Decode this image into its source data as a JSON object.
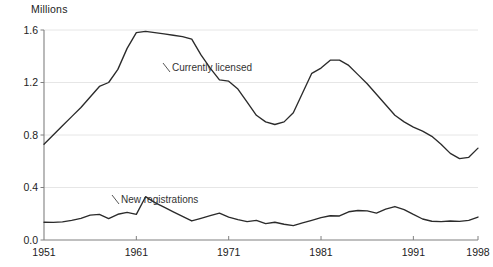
{
  "chart_data": {
    "type": "line",
    "title": "",
    "ylabel": "Millions",
    "xlabel": "",
    "ylim": [
      0.0,
      1.6
    ],
    "xlim": [
      1951,
      1998
    ],
    "grid": true,
    "legend_position": "inline-annotations",
    "y_ticks": [
      "0.0",
      "0.4",
      "0.8",
      "1.2",
      "1.6"
    ],
    "y_tick_values": [
      0.0,
      0.4,
      0.8,
      1.2,
      1.6
    ],
    "x_ticks": [
      "1951",
      "1961",
      "1971",
      "1981",
      "1991",
      "1998"
    ],
    "x_tick_values": [
      1951,
      1961,
      1971,
      1981,
      1991,
      1998
    ],
    "x": [
      1951,
      1952,
      1953,
      1954,
      1955,
      1956,
      1957,
      1958,
      1959,
      1960,
      1961,
      1962,
      1963,
      1964,
      1965,
      1966,
      1967,
      1968,
      1969,
      1970,
      1971,
      1972,
      1973,
      1974,
      1975,
      1976,
      1977,
      1978,
      1979,
      1980,
      1981,
      1982,
      1983,
      1984,
      1985,
      1986,
      1987,
      1988,
      1989,
      1990,
      1991,
      1992,
      1993,
      1994,
      1995,
      1996,
      1997,
      1998
    ],
    "series": [
      {
        "name": "Currently licensed",
        "label_text": "Currently licensed",
        "color": "#2b2b2b",
        "values": [
          0.73,
          0.8,
          0.87,
          0.94,
          1.01,
          1.09,
          1.17,
          1.2,
          1.3,
          1.46,
          1.58,
          1.59,
          1.58,
          1.57,
          1.56,
          1.55,
          1.53,
          1.41,
          1.31,
          1.22,
          1.21,
          1.15,
          1.05,
          0.95,
          0.9,
          0.88,
          0.9,
          0.97,
          1.12,
          1.27,
          1.31,
          1.37,
          1.37,
          1.33,
          1.26,
          1.19,
          1.11,
          1.03,
          0.95,
          0.9,
          0.86,
          0.83,
          0.79,
          0.73,
          0.66,
          0.62,
          0.63,
          0.7
        ]
      },
      {
        "name": "New registrations",
        "label_text": "New registrations",
        "color": "#2b2b2b",
        "values": [
          0.135,
          0.134,
          0.138,
          0.15,
          0.165,
          0.19,
          0.195,
          0.163,
          0.196,
          0.21,
          0.195,
          0.33,
          0.285,
          0.25,
          0.215,
          0.18,
          0.145,
          0.165,
          0.185,
          0.205,
          0.175,
          0.155,
          0.14,
          0.15,
          0.125,
          0.135,
          0.12,
          0.11,
          0.13,
          0.15,
          0.17,
          0.185,
          0.183,
          0.215,
          0.225,
          0.222,
          0.205,
          0.235,
          0.255,
          0.232,
          0.195,
          0.16,
          0.143,
          0.14,
          0.145,
          0.142,
          0.15,
          0.175
        ]
      }
    ],
    "annotations": [
      {
        "text": "Currently licensed",
        "x_px": 172,
        "y_px": 71
      },
      {
        "text": "New registrations",
        "x_px": 121,
        "y_px": 203
      }
    ]
  }
}
